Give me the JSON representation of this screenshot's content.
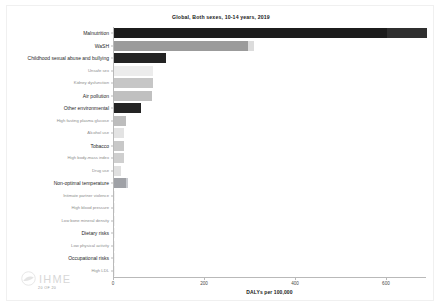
{
  "chart_data": {
    "type": "bar",
    "orientation": "horizontal",
    "title": "Global, Both sexes, 10-14 years, 2019",
    "xlabel": "DALYs per 100,000",
    "ylabel": "",
    "xlim": [
      0,
      688
    ],
    "xticks": [
      0,
      200,
      400,
      600
    ],
    "xticklabels": [
      "0",
      "200",
      "400",
      "600"
    ],
    "grid": false,
    "legend": "none",
    "categories": [
      "Malnutrition",
      "WaSH",
      "Childhood sexual abuse and bullying",
      "Unsafe sex",
      "Kidney dysfunction",
      "Air pollution",
      "Other environmental",
      "High fasting plasma glucose",
      "Alcohol use",
      "Tobacco",
      "High body-mass index",
      "Drug use",
      "Non-optimal temperature",
      "Intimate partner violence",
      "High blood pressure",
      "Low bone mineral density",
      "Dietary risks",
      "Low physical activity",
      "Occupational risks",
      "High LDL"
    ],
    "values": [
      600,
      294,
      115,
      85,
      85,
      83,
      60,
      27,
      23,
      23,
      21,
      16,
      27,
      1,
      1,
      1,
      1,
      1,
      1,
      1
    ],
    "upper_bounds": [
      688,
      308,
      115,
      85,
      85,
      83,
      60,
      27,
      23,
      23,
      21,
      16,
      30,
      1,
      1,
      1,
      1,
      1,
      1,
      1
    ],
    "bar_colors": [
      "#1c1c1c",
      "#9b9b9b",
      "#232323",
      "#ececec",
      "#c6c6c6",
      "#c0c0c0",
      "#232323",
      "#bdbdbd",
      "#e3e3e3",
      "#c8c8c8",
      "#cfcfcf",
      "#e0e0e0",
      "#9fa1a6",
      "#f2f2f2",
      "#f2f2f2",
      "#f2f2f2",
      "#f2f2f2",
      "#f2f2f2",
      "#f2f2f2",
      "#f2f2f2"
    ],
    "bound_colors": [
      "#2f2f2f",
      "#dcdcdc",
      "#232323",
      "#ececec",
      "#c6c6c6",
      "#c0c0c0",
      "#232323",
      "#bdbdbd",
      "#e3e3e3",
      "#c8c8c8",
      "#cfcfcf",
      "#e0e0e0",
      "#c9cbd0",
      "#f2f2f2",
      "#f2f2f2",
      "#f2f2f2",
      "#f2f2f2",
      "#f2f2f2",
      "#f2f2f2",
      "#f2f2f2"
    ],
    "label_sizes": [
      5.0,
      5.0,
      5.0,
      4.2,
      4.2,
      5.0,
      5.0,
      4.2,
      4.2,
      5.0,
      4.2,
      4.2,
      5.0,
      4.2,
      4.2,
      4.2,
      5.0,
      4.2,
      5.0,
      4.2
    ],
    "label_colors": [
      "#1f1f1f",
      "#1f1f1f",
      "#1f1f1f",
      "#8c8c8c",
      "#8c8c8c",
      "#1f1f1f",
      "#1f1f1f",
      "#8c8c8c",
      "#8c8c8c",
      "#1f1f1f",
      "#8c8c8c",
      "#8c8c8c",
      "#1f1f1f",
      "#8c8c8c",
      "#8c8c8c",
      "#8c8c8c",
      "#1f1f1f",
      "#8c8c8c",
      "#1f1f1f",
      "#8c8c8c"
    ]
  },
  "branding": {
    "logo_text": "IHME",
    "logo_sub": "20 OF 20"
  }
}
